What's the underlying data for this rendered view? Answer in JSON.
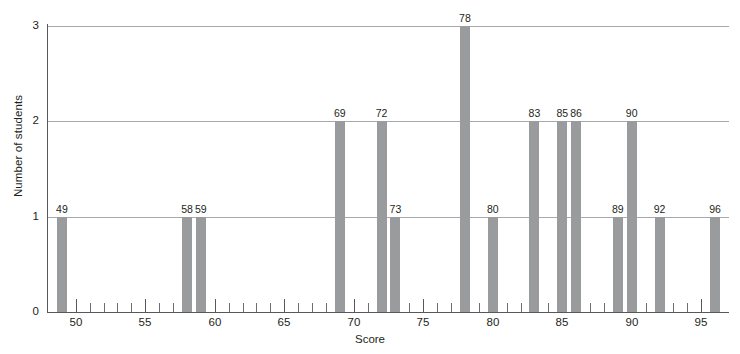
{
  "chart_data": {
    "type": "bar",
    "title": "",
    "xlabel": "Score",
    "ylabel": "Number of students",
    "xlim": [
      48,
      97
    ],
    "ylim": [
      0,
      3
    ],
    "grid": true,
    "legend": false,
    "bar_color": "#9a9b9d",
    "axis_color": "#58585a",
    "grid_color": "#a7a9ac",
    "y_ticks": [
      "0",
      "1",
      "2",
      "3"
    ],
    "x_tick_labels": [
      "50",
      "55",
      "60",
      "65",
      "70",
      "75",
      "80",
      "85",
      "90",
      "95"
    ],
    "x_tick_values": [
      50,
      55,
      60,
      65,
      70,
      75,
      80,
      85,
      90,
      95
    ],
    "x_minor_tick_step": 1,
    "categories": [
      49,
      58,
      59,
      69,
      72,
      73,
      78,
      80,
      83,
      85,
      86,
      89,
      90,
      92,
      96
    ],
    "values": [
      1,
      1,
      1,
      2,
      2,
      1,
      3,
      1,
      2,
      2,
      2,
      1,
      2,
      1,
      1
    ],
    "bar_labels": [
      "49",
      "58",
      "59",
      "69",
      "72",
      "73",
      "78",
      "80",
      "83",
      "85",
      "86",
      "89",
      "90",
      "92",
      "96"
    ],
    "bars": [
      {
        "score": 49,
        "count": 1,
        "label": "49"
      },
      {
        "score": 58,
        "count": 1,
        "label": "58"
      },
      {
        "score": 59,
        "count": 1,
        "label": "59"
      },
      {
        "score": 69,
        "count": 2,
        "label": "69"
      },
      {
        "score": 72,
        "count": 2,
        "label": "72"
      },
      {
        "score": 73,
        "count": 1,
        "label": "73"
      },
      {
        "score": 78,
        "count": 3,
        "label": "78"
      },
      {
        "score": 80,
        "count": 1,
        "label": "80"
      },
      {
        "score": 83,
        "count": 2,
        "label": "83"
      },
      {
        "score": 85,
        "count": 2,
        "label": "85"
      },
      {
        "score": 86,
        "count": 2,
        "label": "86"
      },
      {
        "score": 89,
        "count": 1,
        "label": "89"
      },
      {
        "score": 90,
        "count": 2,
        "label": "90"
      },
      {
        "score": 92,
        "count": 1,
        "label": "92"
      },
      {
        "score": 96,
        "count": 1,
        "label": "96"
      }
    ]
  }
}
